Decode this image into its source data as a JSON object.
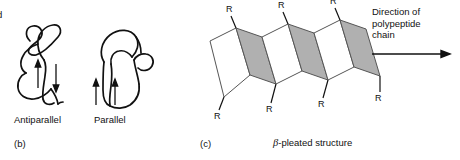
{
  "figure": {
    "background_color": "#ffffff",
    "ink_color": "#111111",
    "pleat_gray": "#b0b0b0",
    "pleat_white": "#ffffff"
  },
  "edge_fragment": {
    "text": "d"
  },
  "panel_b": {
    "caption": "(b)",
    "diagrams": [
      {
        "label": "Antiparallel",
        "arrows": [
          {
            "direction": "up"
          },
          {
            "direction": "down"
          }
        ]
      },
      {
        "label": "Parallel",
        "arrows": [
          {
            "direction": "up"
          },
          {
            "direction": "up"
          }
        ]
      }
    ]
  },
  "panel_c": {
    "caption": "(c)",
    "title": "-pleated structure",
    "beta_symbol": "β",
    "direction_note": "Direction of\npolypeptide\nchain",
    "r_groups_top": [
      "R",
      "R",
      "R"
    ],
    "r_groups_bottom": [
      "R",
      "R",
      "R",
      "R"
    ],
    "arrow_icon": "right-arrow"
  }
}
